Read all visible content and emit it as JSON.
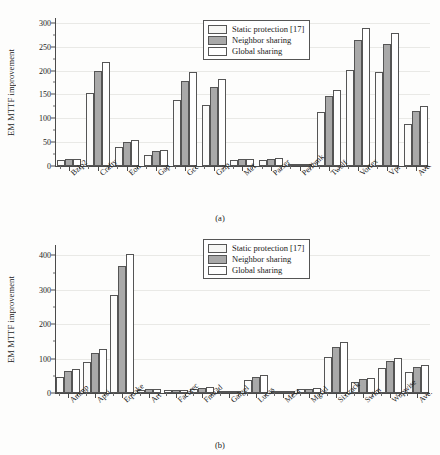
{
  "figure": {
    "panels": [
      {
        "caption": "(a)",
        "ylabel": "EM MTTF improvement",
        "legend": {
          "position": "top-center-right",
          "entries": [
            "Static protection [17]",
            "Neighbor sharing",
            "Global sharing"
          ]
        }
      },
      {
        "caption": "(b)",
        "ylabel": "EM MTTF improvement",
        "legend": {
          "position": "top-center-right",
          "entries": [
            "Static protection [17]",
            "Neighbor sharing",
            "Global sharing"
          ]
        }
      }
    ]
  },
  "chart_data": [
    {
      "type": "bar",
      "title": "(a)",
      "xlabel": "",
      "ylabel": "EM MTTF improvement",
      "ylim": [
        0,
        310
      ],
      "yticks": [
        0,
        50,
        100,
        150,
        200,
        250,
        300
      ],
      "grid": true,
      "legend_position": "upper center",
      "categories": [
        "Bzip2",
        "Crafty",
        "Eon",
        "Gap",
        "Gcc",
        "Gzip",
        "Mcf",
        "Parser",
        "Perlbmk",
        "Twolf",
        "Vortex",
        "Vpr",
        "Ave."
      ],
      "series": [
        {
          "name": "Static protection [17]",
          "values": [
            12,
            153,
            39,
            23,
            138,
            128,
            12,
            12,
            3,
            113,
            202,
            196,
            89
          ]
        },
        {
          "name": "Neighbor sharing",
          "values": [
            14,
            200,
            51,
            31,
            179,
            166,
            14,
            15,
            4,
            147,
            264,
            255,
            115
          ]
        },
        {
          "name": "Global sharing",
          "values": [
            15,
            218,
            55,
            34,
            197,
            182,
            15,
            16,
            4,
            159,
            289,
            278,
            125
          ]
        }
      ]
    },
    {
      "type": "bar",
      "title": "(b)",
      "xlabel": "",
      "ylabel": "EM MTTF improvement",
      "ylim": [
        0,
        430
      ],
      "yticks": [
        0,
        100,
        200,
        300,
        400
      ],
      "grid": true,
      "legend_position": "upper center",
      "categories": [
        "Ammp",
        "Apsi",
        "Equake",
        "Art",
        "Facerec",
        "Fma3d",
        "Galgel",
        "Lucas",
        "Mesa",
        "Mgrid",
        "Sixtrack",
        "Swim",
        "Wupwise",
        "Ave."
      ],
      "series": [
        {
          "name": "Static protection [17]",
          "values": [
            47,
            89,
            284,
            9,
            8,
            12,
            3,
            37,
            1,
            11,
            105,
            32,
            73,
            60
          ]
        },
        {
          "name": "Neighbor sharing",
          "values": [
            63,
            117,
            369,
            11,
            9,
            15,
            4,
            47,
            2,
            12,
            134,
            40,
            92,
            75
          ]
        },
        {
          "name": "Global sharing",
          "values": [
            69,
            127,
            404,
            13,
            10,
            17,
            5,
            52,
            2,
            14,
            147,
            45,
            101,
            82
          ]
        }
      ]
    }
  ]
}
